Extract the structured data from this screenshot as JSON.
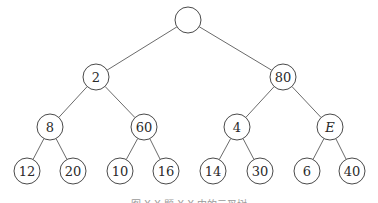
{
  "diagram": {
    "type": "binary-tree",
    "nodes": [
      {
        "id": "root",
        "label": "",
        "x": 188,
        "y": 20
      },
      {
        "id": "n2",
        "label": "2",
        "x": 96,
        "y": 77
      },
      {
        "id": "n80",
        "label": "80",
        "x": 283,
        "y": 77
      },
      {
        "id": "n8",
        "label": "8",
        "x": 50,
        "y": 127
      },
      {
        "id": "n60",
        "label": "60",
        "x": 144,
        "y": 127
      },
      {
        "id": "n4",
        "label": "4",
        "x": 237,
        "y": 127
      },
      {
        "id": "nE",
        "label": "E",
        "x": 330,
        "y": 127,
        "italic": true
      },
      {
        "id": "n12",
        "label": "12",
        "x": 27,
        "y": 171
      },
      {
        "id": "n20",
        "label": "20",
        "x": 73,
        "y": 171
      },
      {
        "id": "n10",
        "label": "10",
        "x": 120,
        "y": 171
      },
      {
        "id": "n16",
        "label": "16",
        "x": 166,
        "y": 171
      },
      {
        "id": "n14",
        "label": "14",
        "x": 213,
        "y": 171
      },
      {
        "id": "n30",
        "label": "30",
        "x": 260,
        "y": 171
      },
      {
        "id": "n6",
        "label": "6",
        "x": 307,
        "y": 171
      },
      {
        "id": "n40",
        "label": "40",
        "x": 352,
        "y": 171
      }
    ],
    "edges": [
      [
        "root",
        "n2"
      ],
      [
        "root",
        "n80"
      ],
      [
        "n2",
        "n8"
      ],
      [
        "n2",
        "n60"
      ],
      [
        "n80",
        "n4"
      ],
      [
        "n80",
        "nE"
      ],
      [
        "n8",
        "n12"
      ],
      [
        "n8",
        "n20"
      ],
      [
        "n60",
        "n10"
      ],
      [
        "n60",
        "n16"
      ],
      [
        "n4",
        "n14"
      ],
      [
        "n4",
        "n30"
      ],
      [
        "nE",
        "n6"
      ],
      [
        "nE",
        "n40"
      ]
    ],
    "node_radius": 13,
    "caption": "图 X.X  题 X.X 中的二叉树"
  }
}
